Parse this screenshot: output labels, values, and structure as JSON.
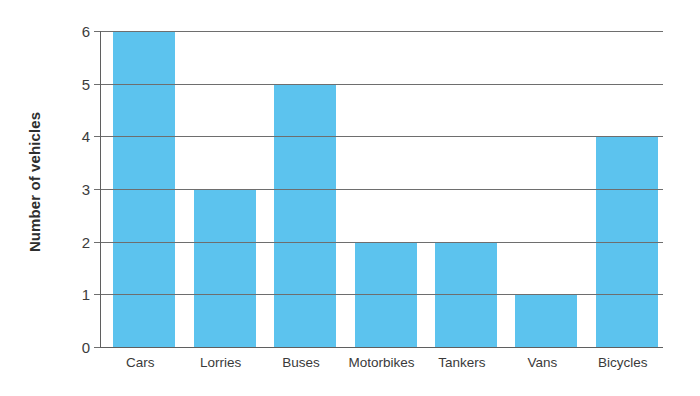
{
  "chart_data": {
    "type": "bar",
    "title": "",
    "subtitle": "",
    "xlabel": "",
    "ylabel": "Number of vehicles",
    "categories": [
      "Cars",
      "Lorries",
      "Buses",
      "Motorbikes",
      "Tankers",
      "Vans",
      "Bicycles"
    ],
    "values": [
      6,
      3,
      5,
      2,
      2,
      1,
      4
    ],
    "ylim": [
      0,
      6
    ],
    "ytick_labels": [
      "0",
      "1",
      "2",
      "3",
      "4",
      "5",
      "6"
    ],
    "ytick_values": [
      0,
      1,
      2,
      3,
      4,
      5,
      6
    ],
    "grid": true,
    "grid_axis": "y",
    "legend": false,
    "legend_position": "none",
    "bar_color": "#5cc3ee",
    "gridline_color": "#6e6e6e",
    "axis_color": "#5f5f5f",
    "text_color": "#3a3a3a",
    "background": "#ffffff"
  },
  "axes": {
    "y_title": "Number of vehicles",
    "ticks": [
      {
        "label": "6",
        "value": 6
      },
      {
        "label": "5",
        "value": 5
      },
      {
        "label": "4",
        "value": 4
      },
      {
        "label": "3",
        "value": 3
      },
      {
        "label": "2",
        "value": 2
      },
      {
        "label": "1",
        "value": 1
      },
      {
        "label": "0",
        "value": 0
      }
    ]
  },
  "bars": [
    {
      "label": "Cars",
      "value": 6
    },
    {
      "label": "Lorries",
      "value": 3
    },
    {
      "label": "Buses",
      "value": 5
    },
    {
      "label": "Motorbikes",
      "value": 2
    },
    {
      "label": "Tankers",
      "value": 2
    },
    {
      "label": "Vans",
      "value": 1
    },
    {
      "label": "Bicycles",
      "value": 4
    }
  ]
}
